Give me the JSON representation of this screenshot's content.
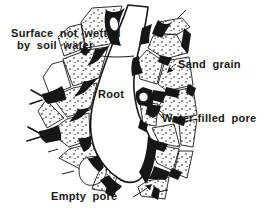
{
  "diagram": {
    "colors": {
      "background": "#ffffff",
      "ink": "#161616"
    },
    "labels": {
      "surface_not_wetted": {
        "line1": "Surface not wetted",
        "line2": "by soil water"
      },
      "root": "Root",
      "sand_grain": "Sand grain",
      "water_filled_pore": "Water-filled pore",
      "empty_pore": "Empty pore"
    }
  }
}
